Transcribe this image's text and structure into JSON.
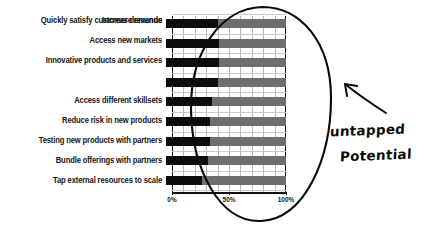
{
  "chart_data": {
    "type": "bar",
    "orientation": "horizontal",
    "title": "",
    "xlabel": "",
    "ylabel": "",
    "xlim": [
      0,
      100
    ],
    "grid": true,
    "legend": false,
    "tick_labels": [
      "0%",
      "50%",
      "100%"
    ],
    "tick_values": [
      0,
      50,
      100
    ],
    "categories": [
      "Increase revenue",
      "Access new markets",
      "Innovative products and services",
      "Quickly satisfy customer demands",
      "Access different skillsets",
      "Reduce risk in new products",
      "Testing new products with partners",
      "Bundle offerings with partners",
      "Tap external resources to scale"
    ],
    "series": [
      {
        "name": "Achieved",
        "color": "#0d0d0d",
        "values": [
          40,
          41,
          41,
          40,
          35,
          33,
          33,
          32,
          26
        ]
      },
      {
        "name": "Remaining (untapped)",
        "color": "#6e6e6e",
        "values": [
          60,
          59,
          59,
          60,
          65,
          67,
          67,
          68,
          74
        ]
      }
    ]
  },
  "annotation": {
    "line1": "untapped",
    "line2": "Potential",
    "arrow_name": "hand-drawn-arrow",
    "ellipse_name": "hand-drawn-ellipse-highlight"
  },
  "colors": {
    "bar_value": "#0d0d0d",
    "bar_total": "#6e6e6e",
    "ink": "#0a0a0a",
    "grid": "#b9b9b9",
    "background": "#ffffff"
  }
}
